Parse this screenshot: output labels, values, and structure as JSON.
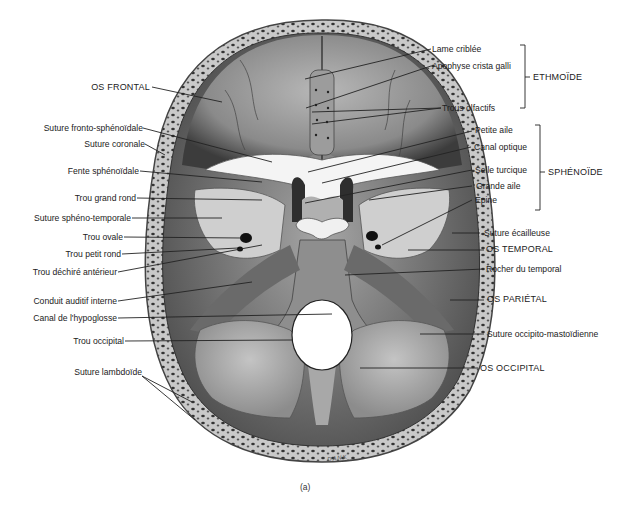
{
  "figure": {
    "caption": "(a)",
    "signature": "DANK",
    "colors": {
      "bone_light": "#d6d6d6",
      "bone_mid": "#9a9a9a",
      "bone_dark": "#3a3a3a",
      "foramen": "#ffffff",
      "leader": "#222222"
    }
  },
  "labels_left": [
    {
      "id": "os-frontal",
      "text": "OS FRONTAL"
    },
    {
      "id": "suture-fronto-sphenoidale",
      "text": "Suture fronto-sphénoïdale"
    },
    {
      "id": "suture-coronale",
      "text": "Suture coronale"
    },
    {
      "id": "fente-sphenoidale",
      "text": "Fente sphénoïdale"
    },
    {
      "id": "trou-grand-rond",
      "text": "Trou grand rond"
    },
    {
      "id": "suture-spheno-temporale",
      "text": "Suture sphéno-temporale"
    },
    {
      "id": "trou-ovale",
      "text": "Trou ovale"
    },
    {
      "id": "trou-petit-rond",
      "text": "Trou petit rond"
    },
    {
      "id": "trou-dechire-anterieur",
      "text": "Trou déchiré antérieur"
    },
    {
      "id": "conduit-auditif-interne",
      "text": "Conduit auditif interne"
    },
    {
      "id": "canal-hypoglosse",
      "text": "Canal de l'hypoglosse"
    },
    {
      "id": "trou-occipital",
      "text": "Trou occipital"
    },
    {
      "id": "suture-lambdoide",
      "text": "Suture lambdoïde"
    }
  ],
  "labels_right": [
    {
      "id": "lame-criblee",
      "text": "Lame criblée"
    },
    {
      "id": "apophyse-crista-galli",
      "text": "Apophyse crista galli"
    },
    {
      "id": "trous-olfactifs",
      "text": "Trous olfactifs"
    },
    {
      "id": "petite-aile",
      "text": "Petite aile"
    },
    {
      "id": "canal-optique",
      "text": "Canal optique"
    },
    {
      "id": "selle-turcique",
      "text": "Selle turcique"
    },
    {
      "id": "grande-aile",
      "text": "Grande aile"
    },
    {
      "id": "epine",
      "text": "Épine"
    },
    {
      "id": "suture-ecailleuse",
      "text": "Suture écailleuse"
    },
    {
      "id": "os-temporal",
      "text": "OS TEMPORAL"
    },
    {
      "id": "rocher-du-temporal",
      "text": "Rocher du temporal"
    },
    {
      "id": "os-parietal",
      "text": "OS PARIÉTAL"
    },
    {
      "id": "suture-occipito-mastoidienne",
      "text": "Suture occipito-mastoïdienne"
    },
    {
      "id": "os-occipital",
      "text": "OS OCCIPITAL"
    }
  ],
  "groups": [
    {
      "id": "ethmoide",
      "text": "ETHMOÏDE"
    },
    {
      "id": "sphenoide",
      "text": "SPHÉNOÏDE"
    }
  ]
}
